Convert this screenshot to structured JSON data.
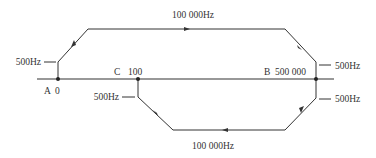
{
  "diagram": {
    "title": "",
    "colors": {
      "line": "#333333",
      "text": "#333333",
      "background": "#ffffff"
    },
    "axis": {
      "x1": 37,
      "x2": 334,
      "y": 79
    },
    "points": [
      {
        "id": "A",
        "label": "A",
        "value": "0",
        "x": 58,
        "y": 79
      },
      {
        "id": "C",
        "label": "C",
        "value": "100",
        "x": 138,
        "y": 79
      },
      {
        "id": "B",
        "label": "B",
        "value": "500 000",
        "x": 316,
        "y": 79
      }
    ],
    "paths": [
      {
        "id": "upper",
        "from": "A",
        "to": "B",
        "points": "58,79 58,62 88,29 285,29 316,62 316,79",
        "label": "100 000Hz",
        "direction": "A to B"
      },
      {
        "id": "lower",
        "from": "B",
        "to": "C",
        "points": "316,79 316,98 285,130 173,130 138,97 138,79",
        "label": "100 000Hz",
        "direction": "B to C"
      }
    ],
    "labels": {
      "upper_rate": "100 000Hz",
      "lower_rate": "100 000Hz",
      "A_accel": "500Hz",
      "B_decel_upper": "500Hz",
      "B_accel_lower": "500Hz",
      "C_decel": "500Hz",
      "A_name": "A",
      "A_value": "0",
      "C_name": "C",
      "C_value": "100",
      "B_name": "B",
      "B_value": "500 000"
    }
  }
}
